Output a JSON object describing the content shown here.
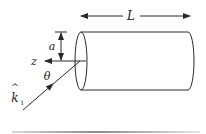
{
  "figure": {
    "type": "cylinder scattering geometry",
    "labels": {
      "length": "L",
      "radius": "a",
      "axis": "z",
      "angle": "θ",
      "incident_wavevector": "k",
      "incident_wavevector_hat": "^",
      "incident_wavevector_subscript": "i"
    },
    "colors": {
      "stroke": "#2a2a2a",
      "background": "#ffffff",
      "bottom_rule": "#9a9a9a"
    }
  }
}
